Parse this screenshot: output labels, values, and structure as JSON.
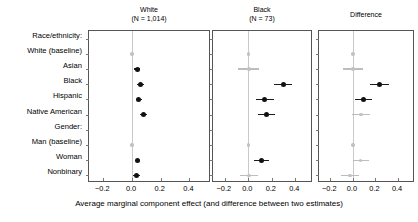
{
  "chart_data": {
    "type": "scatter",
    "subtype": "coefficient-forest-plot",
    "title": "",
    "xlabel": "Average marginal component effect (and difference between two estimates)",
    "ylabel": "",
    "xlim": [
      -0.3,
      0.55
    ],
    "xticks": [
      -0.2,
      0.0,
      0.2,
      0.4
    ],
    "xticklabels": [
      "−0.2",
      "0.0",
      "0.2",
      "0.4"
    ],
    "grid": false,
    "legend": "none",
    "panels": [
      {
        "label": "White",
        "sublabel": "(N = 1,014)",
        "name": "white"
      },
      {
        "label": "Black",
        "sublabel": "(N = 73)",
        "name": "black"
      },
      {
        "label": "Difference",
        "sublabel": "",
        "name": "difference"
      }
    ],
    "categories": [
      {
        "label": "Race/ethnicity:",
        "type": "header"
      },
      {
        "label": "White (baseline)",
        "type": "baseline"
      },
      {
        "label": "Asian",
        "type": "estimate"
      },
      {
        "label": "Black",
        "type": "estimate"
      },
      {
        "label": "Hispanic",
        "type": "estimate"
      },
      {
        "label": "Native American",
        "type": "estimate"
      },
      {
        "label": "Gender:",
        "type": "header"
      },
      {
        "label": "Man (baseline)",
        "type": "baseline"
      },
      {
        "label": "Woman",
        "type": "estimate"
      },
      {
        "label": "Nonbinary",
        "type": "estimate"
      }
    ],
    "series": [
      {
        "name": "White",
        "values": [
          null,
          {
            "estimate": 0.0,
            "low": 0.0,
            "high": 0.0,
            "style": "baseline"
          },
          {
            "estimate": 0.035,
            "low": 0.012,
            "high": 0.058,
            "style": "solid"
          },
          {
            "estimate": 0.06,
            "low": 0.037,
            "high": 0.083,
            "style": "solid"
          },
          {
            "estimate": 0.048,
            "low": 0.025,
            "high": 0.071,
            "style": "solid"
          },
          {
            "estimate": 0.082,
            "low": 0.058,
            "high": 0.106,
            "style": "solid"
          },
          null,
          {
            "estimate": 0.0,
            "low": 0.0,
            "high": 0.0,
            "style": "baseline"
          },
          {
            "estimate": 0.038,
            "low": 0.018,
            "high": 0.058,
            "style": "solid"
          },
          {
            "estimate": 0.032,
            "low": 0.01,
            "high": 0.054,
            "style": "solid"
          }
        ]
      },
      {
        "name": "Black",
        "values": [
          null,
          {
            "estimate": 0.0,
            "low": 0.0,
            "high": 0.0,
            "style": "baseline"
          },
          {
            "estimate": 0.005,
            "low": -0.085,
            "high": 0.095,
            "style": "light"
          },
          {
            "estimate": 0.295,
            "low": 0.215,
            "high": 0.375,
            "style": "solid"
          },
          {
            "estimate": 0.14,
            "low": 0.063,
            "high": 0.217,
            "style": "solid"
          },
          {
            "estimate": 0.155,
            "low": 0.08,
            "high": 0.23,
            "style": "solid"
          },
          null,
          {
            "estimate": 0.0,
            "low": 0.0,
            "high": 0.0,
            "style": "baseline"
          },
          {
            "estimate": 0.11,
            "low": 0.045,
            "high": 0.175,
            "style": "solid"
          },
          {
            "estimate": 0.005,
            "low": -0.07,
            "high": 0.08,
            "style": "light"
          }
        ]
      },
      {
        "name": "Difference",
        "values": [
          null,
          {
            "estimate": 0.0,
            "low": 0.0,
            "high": 0.0,
            "style": "baseline"
          },
          {
            "estimate": 0.0,
            "low": -0.09,
            "high": 0.09,
            "style": "light"
          },
          {
            "estimate": 0.235,
            "low": 0.155,
            "high": 0.32,
            "style": "solid"
          },
          {
            "estimate": 0.095,
            "low": 0.018,
            "high": 0.172,
            "style": "solid"
          },
          {
            "estimate": 0.073,
            "low": -0.005,
            "high": 0.15,
            "style": "light"
          },
          null,
          {
            "estimate": 0.0,
            "low": 0.0,
            "high": 0.0,
            "style": "baseline"
          },
          {
            "estimate": 0.07,
            "low": 0.0,
            "high": 0.14,
            "style": "light"
          },
          {
            "estimate": -0.025,
            "low": -0.105,
            "high": 0.055,
            "style": "light"
          }
        ]
      }
    ]
  }
}
